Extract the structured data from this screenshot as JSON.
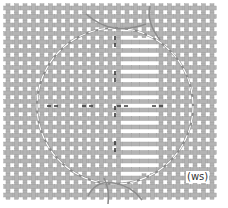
{
  "diagram": {
    "label": "(ws)",
    "colors": {
      "thread": "#b4b4b4",
      "thread_edge": "#9a9a9a",
      "gap": "#ffffff",
      "circle_outline": "#8c8c8c",
      "dash": "#3a3a3a"
    },
    "fabric": {
      "x0": 8,
      "y0": 8,
      "x1": 218,
      "y1": 198,
      "pitch": 8.5
    },
    "circle": {
      "cx": 115,
      "cy": 106,
      "r": 78
    },
    "center_cross": {
      "x": 115,
      "y": 106
    }
  }
}
